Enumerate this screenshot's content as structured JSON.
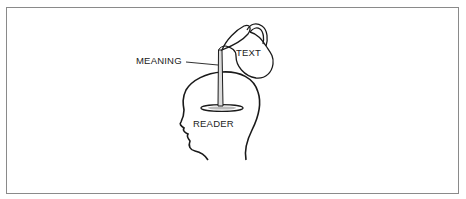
{
  "figure": {
    "labels": {
      "meaning": "MEANING",
      "text": "TEXT",
      "reader": "READER"
    },
    "elements": [
      "pitcher",
      "pouring-stream",
      "head-outline",
      "pool"
    ],
    "colors": {
      "stroke": "#1a1a1a",
      "frame": "#8a8a8a",
      "background": "#ffffff"
    }
  }
}
